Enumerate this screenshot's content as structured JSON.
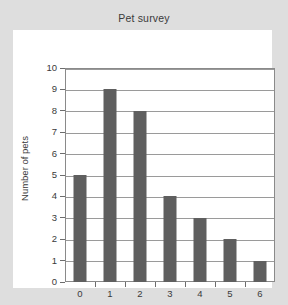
{
  "chart_data": {
    "type": "bar",
    "title": "Pet survey",
    "xlabel": "Number of children",
    "ylabel": "Number of pets",
    "categories": [
      "0",
      "1",
      "2",
      "3",
      "4",
      "5",
      "6"
    ],
    "values": [
      5,
      9,
      8,
      4,
      3,
      2,
      1
    ],
    "ylim": [
      0,
      10
    ],
    "ytick_labels": [
      "0",
      "1",
      "2",
      "3",
      "4",
      "5",
      "6",
      "7",
      "8",
      "9",
      "10"
    ],
    "grid": true,
    "legend": null,
    "colors": {
      "bar": "#5f5f5f",
      "grid": "#9a9a9a",
      "frame": "#8a8a8a",
      "panel_background": "#ffffff",
      "page_background": "#dedede",
      "text": "#3a3a3a"
    }
  }
}
